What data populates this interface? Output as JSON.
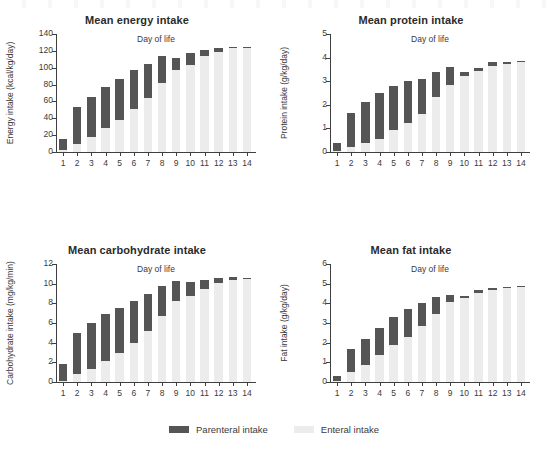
{
  "figure": {
    "legend": {
      "parenteral_label": "Parenteral intake",
      "enteral_label": "Enteral intake",
      "parenteral_color": "#555555",
      "enteral_color": "#ececec"
    }
  },
  "chart_data": [
    {
      "type": "bar",
      "id": "energy",
      "title": "Mean energy intake",
      "xlabel": "Day of life",
      "ylabel": "Energy intake (kcal/kg/day)",
      "categories": [
        "1",
        "2",
        "3",
        "4",
        "5",
        "6",
        "7",
        "8",
        "9",
        "10",
        "11",
        "12",
        "13",
        "14"
      ],
      "ylim": [
        0,
        140
      ],
      "yticks": [
        0,
        20,
        40,
        60,
        80,
        100,
        120,
        140
      ],
      "grid": false,
      "stacked": true,
      "legend_position": "bottom-center",
      "series": [
        {
          "name": "Enteral intake",
          "values": [
            2,
            10,
            18,
            28,
            38,
            51,
            64,
            82,
            97,
            103,
            114,
            119,
            123,
            124
          ]
        },
        {
          "name": "Parenteral intake",
          "values": [
            13,
            43,
            47,
            49,
            49,
            46,
            40,
            32,
            14,
            15,
            7,
            4,
            2,
            1
          ]
        }
      ],
      "totals": [
        15,
        53,
        65,
        77,
        87,
        97,
        104,
        114,
        111,
        118,
        121,
        123,
        125,
        125
      ]
    },
    {
      "type": "bar",
      "id": "protein",
      "title": "Mean protein intake",
      "xlabel": "Day of life",
      "ylabel": "Protein intake (g/kg/day)",
      "categories": [
        "1",
        "2",
        "3",
        "4",
        "5",
        "6",
        "7",
        "8",
        "9",
        "10",
        "11",
        "12",
        "13",
        "14"
      ],
      "ylim": [
        0,
        5
      ],
      "yticks": [
        0,
        1,
        2,
        3,
        4,
        5
      ],
      "grid": false,
      "stacked": true,
      "legend_position": "bottom-center",
      "series": [
        {
          "name": "Enteral intake",
          "values": [
            0.05,
            0.22,
            0.4,
            0.57,
            0.95,
            1.22,
            1.62,
            2.35,
            2.85,
            3.2,
            3.45,
            3.65,
            3.75,
            3.8
          ]
        },
        {
          "name": "Parenteral intake",
          "values": [
            0.35,
            1.45,
            1.7,
            1.92,
            1.85,
            1.78,
            1.47,
            1.05,
            0.75,
            0.2,
            0.1,
            0.17,
            0.07,
            0.05
          ]
        }
      ],
      "totals": [
        0.4,
        1.67,
        2.1,
        2.49,
        2.8,
        3.0,
        3.09,
        3.4,
        3.6,
        3.4,
        3.55,
        3.82,
        3.82,
        3.85
      ]
    },
    {
      "type": "bar",
      "id": "carbohydrate",
      "title": "Mean carbohydrate intake",
      "xlabel": "Day of life",
      "ylabel": "Carbohydrate intake (mg/kg/min)",
      "categories": [
        "1",
        "2",
        "3",
        "4",
        "5",
        "6",
        "7",
        "8",
        "9",
        "10",
        "11",
        "12",
        "13",
        "14"
      ],
      "ylim": [
        0,
        12
      ],
      "yticks": [
        0,
        2,
        4,
        6,
        8,
        10,
        12
      ],
      "grid": false,
      "stacked": true,
      "legend_position": "bottom-center",
      "series": [
        {
          "name": "Enteral intake",
          "values": [
            0.15,
            0.8,
            1.3,
            2.15,
            2.95,
            3.95,
            5.15,
            6.75,
            8.2,
            8.7,
            9.5,
            10.1,
            10.4,
            10.45
          ]
        },
        {
          "name": "Parenteral intake",
          "values": [
            1.65,
            4.2,
            4.7,
            4.75,
            4.55,
            4.25,
            3.85,
            3.05,
            2.1,
            1.5,
            0.85,
            0.5,
            0.25,
            0.15
          ]
        }
      ],
      "totals": [
        1.8,
        5.0,
        6.0,
        6.9,
        7.5,
        8.2,
        9.0,
        9.8,
        10.3,
        10.2,
        10.35,
        10.6,
        10.65,
        10.6
      ]
    },
    {
      "type": "bar",
      "id": "fat",
      "title": "Mean fat intake",
      "xlabel": "Day of life",
      "ylabel": "Fat intake (g/kg/day)",
      "categories": [
        "1",
        "2",
        "3",
        "4",
        "5",
        "6",
        "7",
        "8",
        "9",
        "10",
        "11",
        "12",
        "13",
        "14"
      ],
      "ylim": [
        0,
        6
      ],
      "yticks": [
        0,
        1,
        2,
        3,
        4,
        5,
        6
      ],
      "grid": false,
      "stacked": true,
      "legend_position": "bottom-center",
      "series": [
        {
          "name": "Enteral intake",
          "values": [
            0.05,
            0.5,
            0.85,
            1.35,
            1.9,
            2.3,
            2.85,
            3.45,
            4.05,
            4.25,
            4.55,
            4.7,
            4.8,
            4.82
          ]
        },
        {
          "name": "Parenteral intake",
          "values": [
            0.27,
            1.17,
            1.35,
            1.42,
            1.4,
            1.4,
            1.15,
            0.85,
            0.37,
            0.13,
            0.13,
            0.1,
            0.05,
            0.05
          ]
        }
      ],
      "totals": [
        0.32,
        1.67,
        2.2,
        2.77,
        3.3,
        3.7,
        4.0,
        4.3,
        4.42,
        4.38,
        4.68,
        4.8,
        4.85,
        4.87
      ]
    }
  ]
}
